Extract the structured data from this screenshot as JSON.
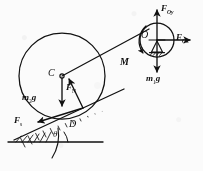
{
  "figure": {
    "type": "free-body-diagram",
    "background_color": "#fbfbfb",
    "stroke_color": "#111111"
  },
  "labels": {
    "cylinder_center": "C",
    "pulley_center": "O",
    "contact_point": "D",
    "moment": "M",
    "angle": "θ",
    "pulley_reaction_y": {
      "symbol": "F",
      "sub": "Oy"
    },
    "pulley_reaction_x": {
      "symbol": "F",
      "sub": "Ox"
    },
    "pulley_weight": {
      "symbol": "m",
      "sub": "1",
      "tail": "g"
    },
    "cylinder_weight": {
      "symbol": "m",
      "sub": "2",
      "tail": "g"
    },
    "normal_force": {
      "symbol": "F",
      "sub": "N"
    },
    "friction_force": {
      "symbol": "F",
      "sub": "s"
    }
  },
  "label_text": {
    "cylinder_center": "C",
    "pulley_center": "O",
    "contact_point": "D",
    "moment": "M",
    "angle": "θ"
  },
  "geometry": {
    "cylinder": {
      "cx": 62,
      "cy": 76,
      "r": 43
    },
    "pulley": {
      "cx": 157,
      "cy": 40,
      "r": 17
    },
    "incline_angle_deg": 25
  }
}
